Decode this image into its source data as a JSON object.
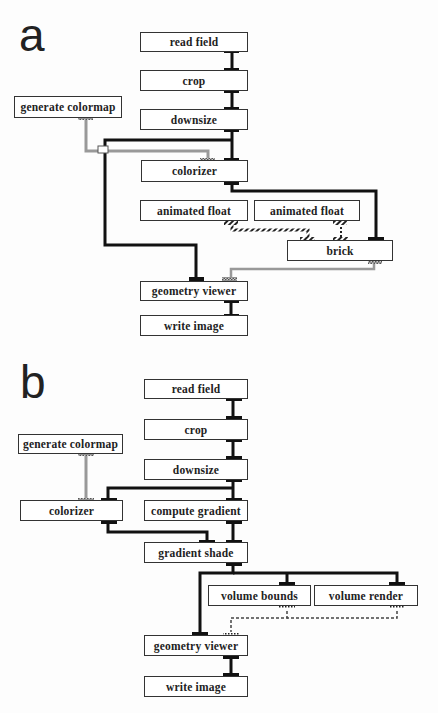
{
  "panels": [
    {
      "label": "a",
      "nodes": {
        "read_field": "read field",
        "crop": "crop",
        "downsize": "downsize",
        "generate_colormap": "generate colormap",
        "colorizer": "colorizer",
        "animated_float_1": "animated float",
        "animated_float_2": "animated float",
        "brick": "brick",
        "geometry_viewer": "geometry viewer",
        "write_image": "write image"
      }
    },
    {
      "label": "b",
      "nodes": {
        "read_field": "read field",
        "crop": "crop",
        "downsize": "downsize",
        "generate_colormap": "generate colormap",
        "colorizer": "colorizer",
        "compute_gradient": "compute gradient",
        "gradient_shade": "gradient shade",
        "volume_bounds": "volume bounds",
        "volume_render": "volume render",
        "geometry_viewer": "geometry viewer",
        "write_image": "write image"
      }
    }
  ],
  "colors": {
    "line": "#1a1a1a",
    "port": "#1a1a1a",
    "colormap_link": "#888888",
    "hatched_link": "#333333",
    "dashed_link": "#555555"
  }
}
